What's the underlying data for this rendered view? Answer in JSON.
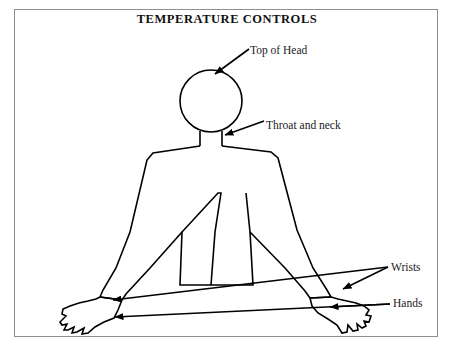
{
  "figure": {
    "title": "TEMPERATURE CONTROLS",
    "background_color": "#ffffff",
    "line_color": "#000000",
    "frame_color": "#8f8f8f",
    "text_color": "#1a1a1a"
  },
  "callouts": [
    {
      "id": "top-of-head",
      "label": "Top of Head",
      "target": "top of the head circle",
      "arrow_from": [
        248,
        50
      ],
      "arrow_to": [
        216,
        73
      ]
    },
    {
      "id": "throat-and-neck",
      "label": "Throat and neck",
      "target": "neck of the figure",
      "arrow_from": [
        264,
        121
      ],
      "arrow_to": [
        224,
        135
      ]
    },
    {
      "id": "wrists",
      "label": "Wrists",
      "target": "both wrists",
      "arrow_from": [
        389,
        266
      ],
      "arrow_to_left": [
        110,
        300
      ],
      "arrow_to_right": [
        341,
        288
      ]
    },
    {
      "id": "hands",
      "label": "Hands",
      "target": "both hands",
      "arrow_from": [
        391,
        303
      ],
      "arrow_to_left": [
        112,
        316
      ],
      "arrow_to_right": [
        328,
        306
      ]
    }
  ],
  "figure_parts": [
    {
      "name": "head",
      "shape": "circle",
      "cx": 211,
      "cy": 101,
      "r": 31
    },
    {
      "name": "neck",
      "shape": "rect-outline",
      "x": 200,
      "y": 130,
      "width": 22,
      "height": 16
    },
    {
      "name": "torso",
      "shape": "outline"
    },
    {
      "name": "left-arm",
      "shape": "outline"
    },
    {
      "name": "right-arm",
      "shape": "outline"
    },
    {
      "name": "left-hand",
      "shape": "outline"
    },
    {
      "name": "right-hand",
      "shape": "outline"
    }
  ]
}
